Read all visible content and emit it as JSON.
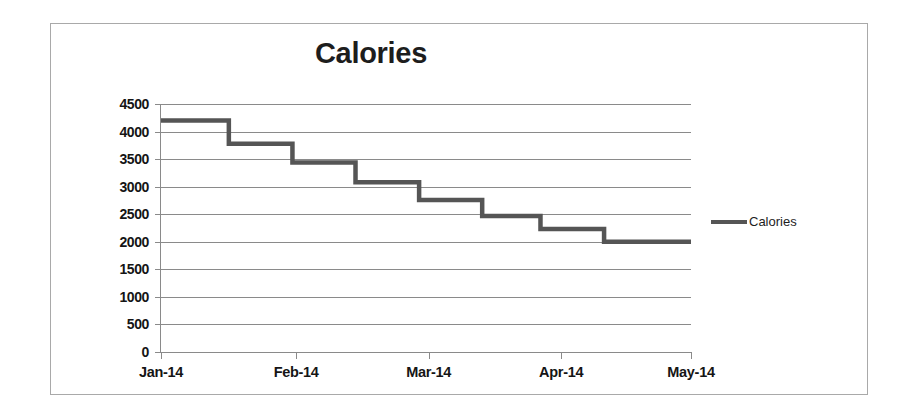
{
  "chart_data": {
    "type": "line",
    "title": "Calories",
    "xlabel": "",
    "ylabel": "",
    "grid": true,
    "legend_position": "right",
    "line_style": "step-after",
    "series_color": "#555555",
    "gridline_color": "#8a8a8a",
    "ylim": [
      0,
      4500
    ],
    "ytick_labels": [
      "4500",
      "4000",
      "3500",
      "3000",
      "2500",
      "2000",
      "1500",
      "1000",
      "500",
      "0"
    ],
    "ytick_values": [
      4500,
      4000,
      3500,
      3000,
      2500,
      2000,
      1500,
      1000,
      500,
      0
    ],
    "xtick_labels": [
      "Jan-14",
      "Feb-14",
      "Mar-14",
      "Apr-14",
      "May-14"
    ],
    "xtick_fractions": [
      0.0,
      0.255,
      0.505,
      0.755,
      1.0
    ],
    "series": [
      {
        "name": "Calories",
        "x_fractions": [
          0.0,
          0.128,
          0.128,
          0.248,
          0.248,
          0.367,
          0.367,
          0.487,
          0.487,
          0.606,
          0.606,
          0.716,
          0.716,
          0.836,
          0.836,
          1.0
        ],
        "values": [
          4200,
          4200,
          3780,
          3780,
          3440,
          3440,
          3080,
          3080,
          2760,
          2760,
          2470,
          2470,
          2230,
          2230,
          2000,
          2000
        ],
        "step_levels": [
          4200,
          3780,
          3440,
          3080,
          2760,
          2470,
          2230,
          2000
        ]
      }
    ],
    "legend": [
      {
        "label": "Calories",
        "color": "#555555"
      }
    ]
  }
}
